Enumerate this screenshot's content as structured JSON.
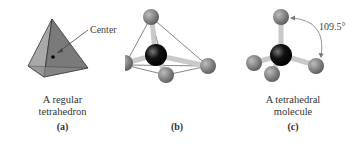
{
  "figure": {
    "panels": [
      {
        "id": "a",
        "caption_lines": [
          "A regular",
          "tetrahedron"
        ],
        "label": "(a)",
        "annotation": "Center"
      },
      {
        "id": "b",
        "caption_lines": [],
        "label": "(b)"
      },
      {
        "id": "c",
        "caption_lines": [
          "A tetrahedral",
          "molecule"
        ],
        "label": "(c)",
        "annotation": "109.5°"
      }
    ],
    "colors": {
      "face_light": "#9a9a9a",
      "face_dark": "#6e6e6e",
      "outer_atom": "#7a7a7a",
      "central_atom": "#111111",
      "bond": "#c8c8c8"
    }
  }
}
